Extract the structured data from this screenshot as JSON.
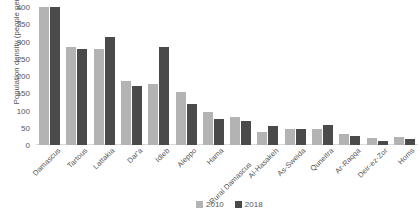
{
  "chart_data": {
    "type": "bar",
    "title": "",
    "xlabel": "",
    "ylabel": "Population density (people per km²)",
    "ylim": [
      0,
      400
    ],
    "yticks": [
      0,
      50,
      100,
      150,
      200,
      250,
      300,
      350,
      400
    ],
    "grid": false,
    "legend_position": "bottom",
    "categories": [
      "Damascus",
      "Tartous",
      "Lattakia",
      "Dar'a",
      "Idleb",
      "Aleppo",
      "Hama",
      "Rural Damascus",
      "Al-Hasakeh",
      "As-Sweida",
      "Quneitra",
      "Ar-Raqqa",
      "Deir-ez-Zor",
      "Homs"
    ],
    "series": [
      {
        "name": "2010",
        "color": "#b3b3b3",
        "values": [
          400,
          285,
          278,
          186,
          178,
          155,
          96,
          80,
          38,
          45,
          46,
          33,
          20,
          22
        ]
      },
      {
        "name": "2018",
        "color": "#4a4a4a",
        "values": [
          400,
          277,
          312,
          171,
          285,
          120,
          76,
          71,
          54,
          45,
          57,
          27,
          12,
          18
        ]
      }
    ]
  },
  "legend": {
    "items": [
      {
        "label": "2010"
      },
      {
        "label": "2018"
      }
    ]
  },
  "colors": {
    "series_2010": "#b3b3b3",
    "series_2018": "#4a4a4a",
    "text": "#555555",
    "background": "#ffffff"
  }
}
